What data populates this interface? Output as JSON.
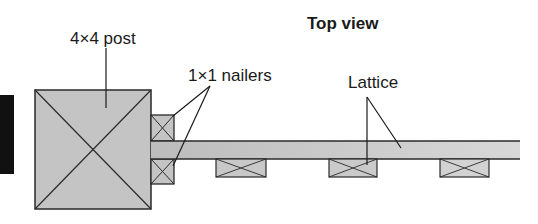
{
  "diagram": {
    "title": "Top view",
    "labels": {
      "post": "4×4 post",
      "nailers": "1×1 nailers",
      "lattice": "Lattice"
    },
    "colors": {
      "fill": "#c4c4c4",
      "stroke": "#2a2a2a",
      "dark_edge": "#111111",
      "background": "#ffffff"
    },
    "parts": [
      {
        "name": "4×4 post",
        "count": 1
      },
      {
        "name": "1×1 nailer",
        "count": 2
      },
      {
        "name": "lattice strip",
        "count": 1
      },
      {
        "name": "lattice block",
        "count": 3
      }
    ]
  }
}
